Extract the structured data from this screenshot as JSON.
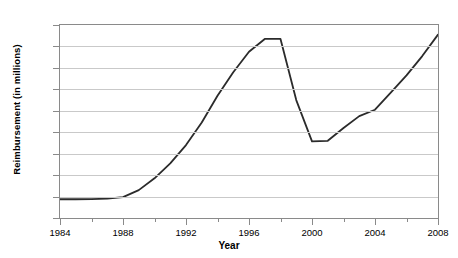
{
  "chart_data": {
    "type": "line",
    "title": "",
    "xlabel": "Year",
    "ylabel": "Reimbursement (in millions)",
    "xlim": [
      1984,
      2008
    ],
    "ylim": [
      0,
      18000
    ],
    "ygrid": true,
    "xgrid": false,
    "legend": "none",
    "line_color": "#2b2b2b",
    "grid_color": "#c9c9c9",
    "axis_color": "#8a8a8a",
    "yticks": [
      0,
      2000,
      4000,
      6000,
      8000,
      10000,
      12000,
      14000,
      16000,
      18000
    ],
    "ytick_labels": [
      "0",
      "2000",
      "4000",
      "6000",
      "8000",
      "10000",
      "12000",
      "14000",
      "16000",
      "18000"
    ],
    "xticks_major": [
      1984,
      1988,
      1992,
      1996,
      2000,
      2004,
      2008
    ],
    "xtick_labels": [
      "1984",
      "1988",
      "1992",
      "1996",
      "2000",
      "2004",
      "2008"
    ],
    "xticks_minor": [
      1986,
      1990,
      1994,
      1998,
      2002,
      2006
    ],
    "x": [
      1984,
      1985,
      1986,
      1987,
      1988,
      1989,
      1990,
      1991,
      1992,
      1993,
      1994,
      1995,
      1996,
      1997,
      1998,
      1999,
      2000,
      2001,
      2002,
      2003,
      2004,
      2005,
      2006,
      2007,
      2008
    ],
    "values": [
      1750,
      1750,
      1760,
      1800,
      1950,
      2600,
      3700,
      5100,
      6800,
      8900,
      11400,
      13600,
      15500,
      16700,
      16700,
      11000,
      7150,
      7200,
      8400,
      9500,
      10100,
      11700,
      13300,
      15100,
      17100
    ],
    "series_name": "Reimbursement"
  },
  "cropped_title_hint": "—————————"
}
